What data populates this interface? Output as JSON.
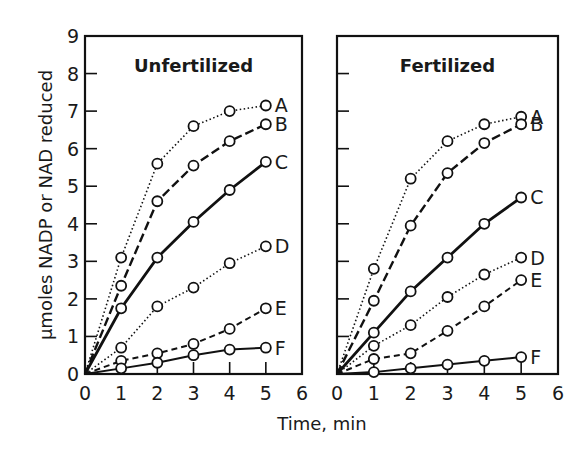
{
  "chart_data": [
    {
      "type": "line",
      "title": "Unfertilized",
      "xlabel": "Time, min",
      "ylabel": "µmoles NADP or NAD reduced",
      "xlim": [
        0,
        6
      ],
      "ylim": [
        0,
        9
      ],
      "xticks": [
        "0",
        "1",
        "2",
        "3",
        "4",
        "5",
        "6"
      ],
      "yticks": [
        "0",
        "1",
        "2",
        "3",
        "4",
        "5",
        "6",
        "7",
        "8",
        "9"
      ],
      "grid": false,
      "legend": "inline labels at line ends",
      "x": [
        0,
        1,
        2,
        3,
        4,
        5
      ],
      "series": [
        {
          "name": "A",
          "style": "dotted",
          "values": [
            0,
            3.1,
            5.6,
            6.6,
            7.0,
            7.15
          ]
        },
        {
          "name": "B",
          "style": "dashed-long",
          "values": [
            0,
            2.35,
            4.6,
            5.55,
            6.2,
            6.65
          ]
        },
        {
          "name": "C",
          "style": "solid-thick",
          "values": [
            0,
            1.75,
            3.1,
            4.05,
            4.9,
            5.65
          ]
        },
        {
          "name": "D",
          "style": "dotted",
          "values": [
            0,
            0.7,
            1.8,
            2.3,
            2.95,
            3.4
          ]
        },
        {
          "name": "E",
          "style": "dashed",
          "values": [
            0,
            0.35,
            0.55,
            0.8,
            1.2,
            1.75
          ]
        },
        {
          "name": "F",
          "style": "solid",
          "values": [
            0,
            0.15,
            0.3,
            0.5,
            0.65,
            0.7
          ]
        }
      ]
    },
    {
      "type": "line",
      "title": "Fertilized",
      "xlabel": "Time, min",
      "ylabel": "µmoles NADP or NAD reduced",
      "xlim": [
        0,
        6
      ],
      "ylim": [
        0,
        9
      ],
      "xticks": [
        "0",
        "1",
        "2",
        "3",
        "4",
        "5",
        "6"
      ],
      "grid": false,
      "legend": "inline labels at line ends",
      "x": [
        0,
        1,
        2,
        3,
        4,
        5
      ],
      "series": [
        {
          "name": "A",
          "style": "dotted",
          "values": [
            0,
            2.8,
            5.2,
            6.2,
            6.65,
            6.85
          ]
        },
        {
          "name": "B",
          "style": "dashed-long",
          "values": [
            0,
            1.95,
            3.95,
            5.35,
            6.15,
            6.65
          ]
        },
        {
          "name": "C",
          "style": "solid-thick",
          "values": [
            0,
            1.1,
            2.2,
            3.1,
            4.0,
            4.7
          ]
        },
        {
          "name": "D",
          "style": "dotted",
          "values": [
            0,
            0.75,
            1.3,
            2.05,
            2.65,
            3.1
          ]
        },
        {
          "name": "E",
          "style": "dashed",
          "values": [
            0,
            0.4,
            0.55,
            1.15,
            1.8,
            2.5
          ]
        },
        {
          "name": "F",
          "style": "solid",
          "values": [
            0,
            0.05,
            0.15,
            0.25,
            0.35,
            0.45
          ]
        }
      ]
    }
  ],
  "labels": {
    "ylabel": "µmoles NADP or NAD reduced",
    "xlabel": "Time, min",
    "panel_left_title": "Unfertilized",
    "panel_right_title": "Fertilized"
  }
}
